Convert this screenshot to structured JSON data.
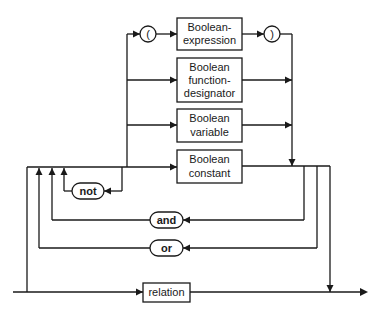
{
  "diagram": {
    "type": "syntax-diagram",
    "nodes": {
      "lparen": "(",
      "rparen": ")",
      "bool_expr": [
        "Boolean-",
        "expression"
      ],
      "bool_func": [
        "Boolean",
        "function-",
        "designator"
      ],
      "bool_var": [
        "Boolean",
        "variable"
      ],
      "bool_const": [
        "Boolean",
        "constant"
      ],
      "not": "not",
      "and": "and",
      "or": "or",
      "relation": "relation"
    },
    "colors": {
      "line": "#1a1a1a",
      "background": "#ffffff"
    }
  }
}
